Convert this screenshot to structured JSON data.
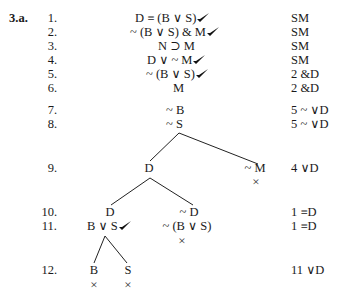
{
  "problem_label": "3.a.",
  "rows": [
    {
      "n": "1.",
      "formula": "D ≡ (B ∨ S)",
      "checked": true,
      "just": "SM"
    },
    {
      "n": "2.",
      "formula": "~ (B ∨ S) & M",
      "checked": true,
      "just": "SM"
    },
    {
      "n": "3.",
      "formula": "N ⊃ M",
      "checked": false,
      "just": "SM"
    },
    {
      "n": "4.",
      "formula": "D ∨ ~ M",
      "checked": true,
      "just": "SM"
    },
    {
      "n": "5.",
      "formula": "~ (B ∨ S)",
      "checked": true,
      "just": "2 &D"
    },
    {
      "n": "6.",
      "formula": "M",
      "checked": false,
      "just": "2 &D"
    },
    {
      "n": "7.",
      "formula": "~ B",
      "checked": false,
      "just": "5 ~ ∨D"
    },
    {
      "n": "8.",
      "formula": "~ S",
      "checked": false,
      "just": "5 ~ ∨D"
    }
  ],
  "tree": {
    "row9": {
      "n": "9.",
      "left": "D",
      "right": "~ M",
      "right_closed": "×",
      "just": "4 ∨D"
    },
    "row10": {
      "n": "10.",
      "left": "D",
      "right": "~ D",
      "just": "1 ≡D"
    },
    "row11": {
      "n": "11.",
      "left": "B ∨ S",
      "left_checked": true,
      "right": "~ (B ∨ S)",
      "right_closed": "×",
      "just": "1 ≡D"
    },
    "row12": {
      "n": "12.",
      "left": "B",
      "right": "S",
      "left_closed": "×",
      "right_closed": "×",
      "just": "11 ∨D"
    }
  },
  "icons": {
    "check": "check-mark-icon",
    "closed": "closed-branch-x-icon"
  }
}
